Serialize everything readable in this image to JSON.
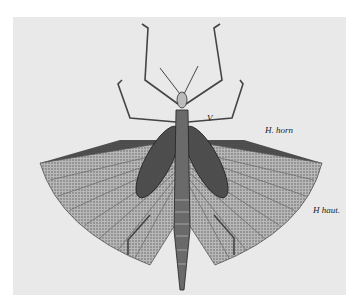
{
  "illustration": {
    "subject": "grasshopper-wings-spread",
    "labels": {
      "v": "V",
      "h_horn": "H. horn",
      "h_haut": "H haut."
    },
    "colors": {
      "background": "#e9e9e9",
      "ink": "#2a2a2a",
      "wing_dark": "#4a4a4a",
      "wing_light": "#9a9a9a"
    }
  }
}
